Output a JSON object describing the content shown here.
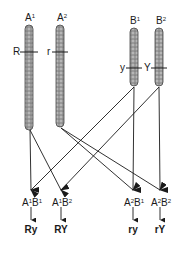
{
  "chromosomes": [
    {
      "id": "A1",
      "base": "A",
      "sup": "1",
      "allele": "R",
      "allele_side": "left"
    },
    {
      "id": "A2",
      "base": "A",
      "sup": "2",
      "allele": "r",
      "allele_side": "left"
    },
    {
      "id": "B1",
      "base": "B",
      "sup": "1",
      "allele": "y",
      "allele_side": "left"
    },
    {
      "id": "B2",
      "base": "B",
      "sup": "2",
      "allele": "Y",
      "allele_side": "left"
    }
  ],
  "gametes": [
    {
      "label": [
        {
          "base": "A",
          "sup": "1"
        },
        {
          "base": "B",
          "sup": "1"
        }
      ],
      "phenotype": "Ry"
    },
    {
      "label": [
        {
          "base": "A",
          "sup": "1"
        },
        {
          "base": "B",
          "sup": "2"
        }
      ],
      "phenotype": "RY"
    },
    {
      "label": [
        {
          "base": "A",
          "sup": "2"
        },
        {
          "base": "B",
          "sup": "1"
        }
      ],
      "phenotype": "ry"
    },
    {
      "label": [
        {
          "base": "A",
          "sup": "2"
        },
        {
          "base": "B",
          "sup": "2"
        }
      ],
      "phenotype": "rY"
    }
  ],
  "colors": {
    "ink": "#1a1a1a",
    "chromosome": "#8a8a8a"
  }
}
